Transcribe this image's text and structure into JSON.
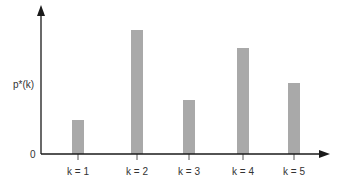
{
  "chart_data": {
    "type": "bar",
    "title": "",
    "xlabel": "",
    "ylabel": "p*(k)",
    "y_origin_label": "0",
    "categories": [
      "k = 1",
      "k = 2",
      "k = 3",
      "k = 4",
      "k = 5"
    ],
    "values": [
      34,
      124,
      54,
      106,
      71
    ],
    "value_units": "relative (no numeric y-scale shown)",
    "ylim": [
      0,
      148
    ],
    "grid": false,
    "legend": null,
    "bar_color": "#a9a9a9",
    "axis_color": "#1a1a1a"
  },
  "labels": {
    "ylabel": "p*(k)",
    "origin": "0",
    "categories": [
      "k = 1",
      "k = 2",
      "k = 3",
      "k = 4",
      "k = 5"
    ]
  }
}
